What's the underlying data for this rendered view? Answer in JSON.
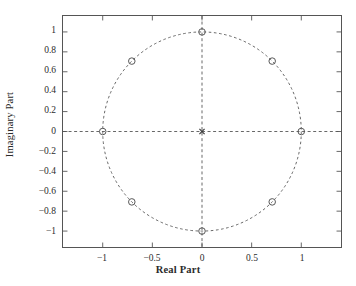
{
  "chart_data": {
    "type": "scatter",
    "title": "",
    "xlabel": "Real Part",
    "ylabel": "Imaginary Part",
    "xlim": [
      -1.4,
      1.4
    ],
    "ylim": [
      -1.16,
      1.16
    ],
    "xticks": [
      -1,
      -0.5,
      0,
      0.5,
      1
    ],
    "xticklabels": [
      "−1",
      "−0.5",
      "0",
      "0.5",
      "1"
    ],
    "yticks": [
      1,
      0.8,
      0.6,
      0.4,
      0.2,
      0,
      -0.2,
      -0.4,
      -0.6,
      -0.8,
      -1
    ],
    "yticklabels": [
      "1",
      "0.8",
      "0.6",
      "0.4",
      "0.2",
      "0",
      "−0.2",
      "−0.4",
      "−0.6",
      "−0.8",
      "−1"
    ],
    "grid": false,
    "legend": null,
    "annotations": [],
    "reference_lines": [
      {
        "name": "unit-circle",
        "type": "circle",
        "center": [
          0,
          0
        ],
        "radius": 1,
        "style": "dashed",
        "color": "#555555"
      },
      {
        "name": "real-axis",
        "type": "hline",
        "y": 0,
        "style": "dashed",
        "color": "#555555"
      },
      {
        "name": "imaginary-axis",
        "type": "vline",
        "x": 0,
        "style": "dashed",
        "color": "#555555"
      }
    ],
    "series": [
      {
        "name": "zeros",
        "marker": "o",
        "color": "#555555",
        "points": [
          {
            "x": 1,
            "y": 0
          },
          {
            "x": 0.7071,
            "y": 0.7071
          },
          {
            "x": 0,
            "y": 1
          },
          {
            "x": -0.7071,
            "y": 0.7071
          },
          {
            "x": -1,
            "y": 0
          },
          {
            "x": -0.7071,
            "y": -0.7071
          },
          {
            "x": 0,
            "y": -1
          },
          {
            "x": 0.7071,
            "y": -0.7071
          }
        ]
      },
      {
        "name": "poles",
        "marker": "x",
        "color": "#3a3a3a",
        "points": [
          {
            "x": 0,
            "y": 0
          }
        ]
      }
    ]
  },
  "figure": {
    "background": "#ffffff",
    "frame_color": "#555555",
    "text_color": "#2b2b2b"
  }
}
